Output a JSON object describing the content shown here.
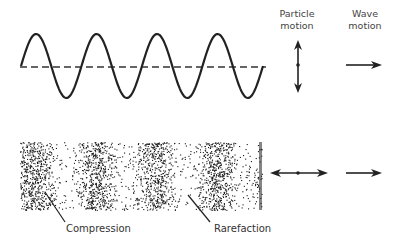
{
  "transverse": {
    "cycles": 4,
    "particle_motion_label": [
      "Particle",
      "motion"
    ],
    "wave_motion_label": [
      "Wave",
      "motion"
    ]
  },
  "longitudinal": {
    "compression_count": 4,
    "labels": {
      "compression": "Compression",
      "rarefaction": "Rarefaction"
    }
  },
  "colors": {
    "ink": "#222222",
    "dots": "#1a1a1a"
  }
}
